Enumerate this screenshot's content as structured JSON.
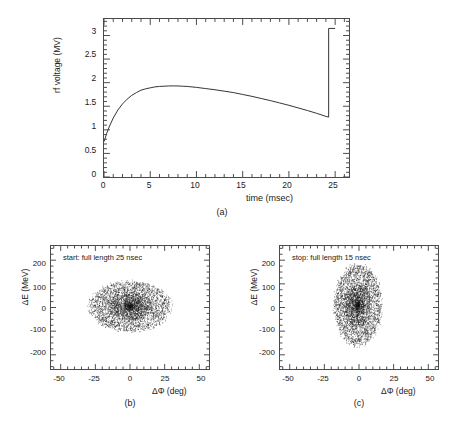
{
  "figure": {
    "panels": [
      {
        "id": "a",
        "caption": "(a)"
      },
      {
        "id": "b",
        "caption": "(b)"
      },
      {
        "id": "c",
        "caption": "(c)"
      }
    ]
  },
  "chart_data": [
    {
      "type": "line",
      "panel": "(a)",
      "title": "",
      "xlabel": "time (msec)",
      "ylabel": "rf voltage (MV)",
      "xlim": [
        0,
        26.5
      ],
      "ylim": [
        0,
        3.35
      ],
      "xticks": [
        0,
        5,
        10,
        15,
        20,
        25
      ],
      "yticks": [
        0,
        0.5,
        1,
        1.5,
        2,
        2.5,
        3
      ],
      "xtick_labels": [
        "0",
        "5",
        "10",
        "15",
        "20",
        "25"
      ],
      "ytick_labels": [
        "0",
        "0.5",
        "1",
        "1.5",
        "2",
        "2.5",
        "3"
      ],
      "minor_ticks": true,
      "grid": false,
      "legend": "none",
      "series": [
        {
          "name": "rf voltage",
          "x": [
            0,
            0.3,
            0.6,
            1.0,
            1.5,
            2.0,
            2.5,
            3.0,
            3.5,
            4.0,
            4.5,
            5.0,
            5.5,
            6.0,
            6.5,
            7.0,
            7.5,
            8.0,
            8.5,
            9.0,
            10.0,
            11.0,
            12.0,
            13.0,
            14.0,
            15.0,
            16.0,
            17.0,
            18.0,
            19.0,
            20.0,
            21.0,
            22.0,
            23.0,
            24.0,
            24.3,
            24.3,
            25.0
          ],
          "y": [
            0.75,
            0.93,
            1.08,
            1.25,
            1.42,
            1.55,
            1.65,
            1.73,
            1.79,
            1.84,
            1.87,
            1.89,
            1.91,
            1.92,
            1.925,
            1.93,
            1.932,
            1.93,
            1.925,
            1.92,
            1.9,
            1.875,
            1.85,
            1.82,
            1.79,
            1.75,
            1.71,
            1.665,
            1.62,
            1.57,
            1.52,
            1.465,
            1.41,
            1.35,
            1.285,
            1.27,
            3.15,
            3.15
          ]
        }
      ],
      "annotations": [
        {
          "text": "voltage jump at t = 24.3 msec from 1.27 MV to 3.15 MV"
        }
      ]
    },
    {
      "type": "scatter",
      "panel": "(b)",
      "title": "start: full length 25 nsec",
      "xlabel": "ΔΦ  (deg)",
      "ylabel": "ΔE  (MeV)",
      "xlim": [
        -57,
        57
      ],
      "ylim": [
        -260,
        260
      ],
      "xticks": [
        -50,
        -25,
        0,
        25,
        50
      ],
      "yticks": [
        -200,
        -100,
        0,
        100,
        200
      ],
      "xtick_labels": [
        "-50",
        "-25",
        "0",
        "25",
        "50"
      ],
      "ytick_labels": [
        "-200",
        "-100",
        "0",
        "100",
        "200"
      ],
      "minor_ticks": true,
      "grid": false,
      "legend": "none",
      "n_points": 4200,
      "distribution": "gaussian-ellipse",
      "center": [
        0,
        5
      ],
      "semi_axis_x_deg": 29,
      "semi_axis_y_mev": 105,
      "core_fraction": 0.3
    },
    {
      "type": "scatter",
      "panel": "(c)",
      "title": "stop: full length 15 nsec",
      "xlabel": "ΔΦ  (deg)",
      "ylabel": "ΔE  (MeV)",
      "xlim": [
        -57,
        57
      ],
      "ylim": [
        -260,
        260
      ],
      "xticks": [
        -50,
        -25,
        0,
        25,
        50
      ],
      "yticks": [
        -200,
        -100,
        0,
        100,
        200
      ],
      "xtick_labels": [
        "-50",
        "-25",
        "0",
        "25",
        "50"
      ],
      "ytick_labels": [
        "-200",
        "-100",
        "0",
        "100",
        "200"
      ],
      "minor_ticks": true,
      "grid": false,
      "legend": "none",
      "n_points": 4200,
      "distribution": "gaussian-ellipse",
      "center": [
        -1,
        10
      ],
      "semi_axis_x_deg": 17,
      "semi_axis_y_mev": 170,
      "core_fraction": 0.3
    }
  ]
}
